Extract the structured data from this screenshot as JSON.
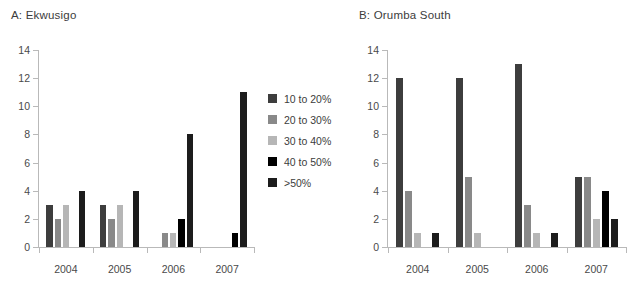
{
  "figure": {
    "panels": [
      {
        "id": "a",
        "title": "A: Ekwusigo"
      },
      {
        "id": "b",
        "title": "B: Orumba South"
      }
    ]
  },
  "legend": {
    "position": "center-right",
    "entries": [
      {
        "label": "10 to 20%",
        "color": "#3d3d3d"
      },
      {
        "label": "20 to 30%",
        "color": "#898989"
      },
      {
        "label": "30 to 40%",
        "color": "#b6b6b6"
      },
      {
        "label": "40 to 50%",
        "color": "#000000"
      },
      {
        "label": ">50%",
        "color": "#1c1c1c"
      }
    ]
  },
  "axis": {
    "yticks": [
      "0",
      "2",
      "4",
      "6",
      "8",
      "10",
      "12",
      "14"
    ],
    "ytick_values": [
      0,
      2,
      4,
      6,
      8,
      10,
      12,
      14
    ],
    "ylim": [
      0,
      14
    ],
    "xlabels": [
      "2004",
      "2005",
      "2006",
      "2007"
    ]
  },
  "chart_data": [
    {
      "type": "bar",
      "title": "A: Ekwusigo",
      "xlabel": "",
      "ylabel": "",
      "ylim": [
        0,
        14
      ],
      "grid": false,
      "legend_position": "center-right",
      "categories": [
        "2004",
        "2005",
        "2006",
        "2007"
      ],
      "series": [
        {
          "name": "10 to 20%",
          "color": "#3d3d3d",
          "values": [
            3,
            3,
            0,
            0
          ]
        },
        {
          "name": "20 to 30%",
          "color": "#898989",
          "values": [
            2,
            2,
            1,
            0
          ]
        },
        {
          "name": "30 to 40%",
          "color": "#b6b6b6",
          "values": [
            3,
            3,
            1,
            0
          ]
        },
        {
          "name": "40 to 50%",
          "color": "#000000",
          "values": [
            0,
            0,
            2,
            1
          ]
        },
        {
          "name": ">50%",
          "color": "#1c1c1c",
          "values": [
            4,
            4,
            8,
            11
          ]
        }
      ]
    },
    {
      "type": "bar",
      "title": "B: Orumba South",
      "xlabel": "",
      "ylabel": "",
      "ylim": [
        0,
        14
      ],
      "grid": false,
      "legend_position": "center-right",
      "categories": [
        "2004",
        "2005",
        "2006",
        "2007"
      ],
      "series": [
        {
          "name": "10 to 20%",
          "color": "#3d3d3d",
          "values": [
            12,
            12,
            13,
            5
          ]
        },
        {
          "name": "20 to 30%",
          "color": "#898989",
          "values": [
            4,
            5,
            3,
            5
          ]
        },
        {
          "name": "30 to 40%",
          "color": "#b6b6b6",
          "values": [
            1,
            1,
            1,
            2
          ]
        },
        {
          "name": "40 to 50%",
          "color": "#000000",
          "values": [
            0,
            0,
            0,
            4
          ]
        },
        {
          "name": ">50%",
          "color": "#1c1c1c",
          "values": [
            1,
            0,
            1,
            2
          ]
        }
      ]
    }
  ]
}
